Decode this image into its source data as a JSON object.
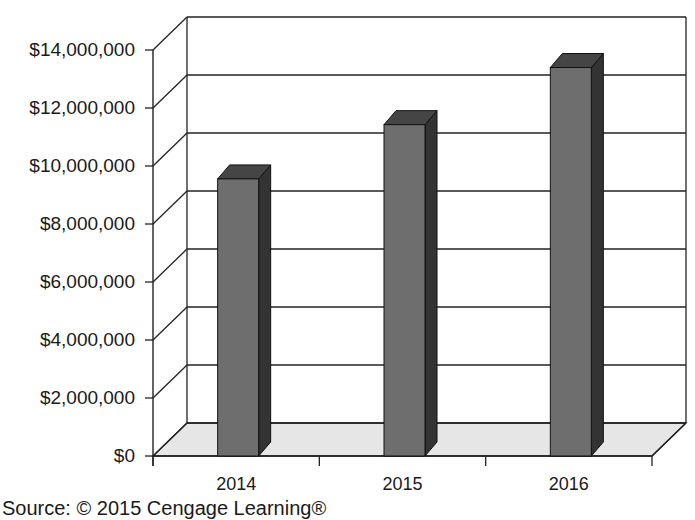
{
  "chart_data": {
    "type": "bar",
    "style": "3d-column",
    "title": "",
    "xlabel": "",
    "ylabel": "",
    "categories": [
      "2014",
      "2015",
      "2016"
    ],
    "values": [
      9700000,
      11600000,
      13600000
    ],
    "ylim": [
      0,
      14000000
    ],
    "yticks": [
      0,
      2000000,
      4000000,
      6000000,
      8000000,
      10000000,
      12000000,
      14000000
    ],
    "ytick_labels": [
      "$0",
      "$2,000,000",
      "$4,000,000",
      "$6,000,000",
      "$8,000,000",
      "$10,000,000",
      "$12,000,000",
      "$14,000,000"
    ],
    "grid": true,
    "legend": null,
    "colors": {
      "bar_front": "#6e6e6e",
      "bar_top": "#454545",
      "bar_side": "#333333",
      "floor": "#e6e6e6",
      "grid": "#222222"
    }
  },
  "source_note": "Source: © 2015 Cengage Learning®"
}
